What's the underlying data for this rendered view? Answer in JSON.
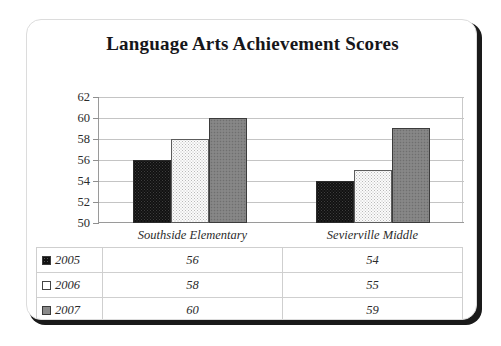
{
  "card": {
    "title": "Language Arts Achievement Scores"
  },
  "chart_data": {
    "type": "bar",
    "title": "Language Arts Achievement Scores",
    "xlabel": "",
    "ylabel": "",
    "ylim": [
      50,
      62
    ],
    "ytick_step": 2,
    "yticks": [
      62,
      60,
      58,
      56,
      54,
      52,
      50
    ],
    "grid": true,
    "legend_position": "bottom-left-table",
    "categories": [
      "Southside Elementary",
      "Sevierville Middle"
    ],
    "series": [
      {
        "name": "2005",
        "values": [
          56,
          54
        ],
        "color": "#111111",
        "swatch": "black-dotted"
      },
      {
        "name": "2006",
        "values": [
          58,
          55
        ],
        "color": "#fbfbfb",
        "swatch": "white-dotted"
      },
      {
        "name": "2007",
        "values": [
          60,
          59
        ],
        "color": "#828282",
        "swatch": "gray-dotted"
      }
    ]
  },
  "table": {
    "corner_label": "",
    "column_headers": [
      "Southside Elementary",
      "Sevierville Middle"
    ],
    "rows": [
      {
        "label": "2005",
        "values": [
          "56",
          "54"
        ]
      },
      {
        "label": "2006",
        "values": [
          "58",
          "55"
        ]
      },
      {
        "label": "2007",
        "values": [
          "60",
          "59"
        ]
      }
    ]
  }
}
